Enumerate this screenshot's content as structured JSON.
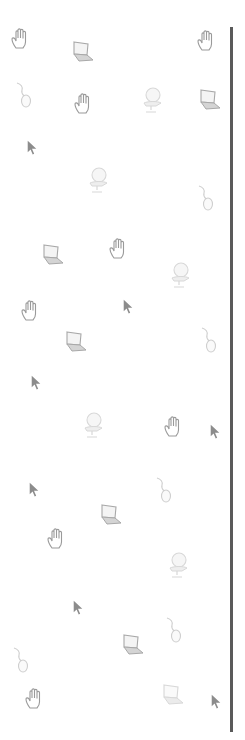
{
  "colors": {
    "background": "#ffffff",
    "rule": "#5a5a5a",
    "hand_stroke": "#9a9a9a",
    "laptop_stroke": "#a8a8a8",
    "laptop_fill": "#d4d4d4",
    "mouse_stroke": "#cfcfcf",
    "chair_stroke": "#d8d8d8",
    "arrow_fill": "#8c8c8c"
  },
  "rule": {
    "x": 230,
    "top": 27,
    "height": 705
  },
  "icons": [
    {
      "type": "hand-icon",
      "x": 22,
      "y": 40
    },
    {
      "type": "hand-icon",
      "x": 208,
      "y": 42
    },
    {
      "type": "hand-icon",
      "x": 85,
      "y": 105
    },
    {
      "type": "hand-icon",
      "x": 120,
      "y": 250
    },
    {
      "type": "hand-icon",
      "x": 32,
      "y": 312
    },
    {
      "type": "hand-icon",
      "x": 175,
      "y": 428
    },
    {
      "type": "hand-icon",
      "x": 58,
      "y": 540
    },
    {
      "type": "hand-icon",
      "x": 36,
      "y": 700
    },
    {
      "type": "laptop-icon",
      "x": 82,
      "y": 52
    },
    {
      "type": "laptop-icon",
      "x": 209,
      "y": 100
    },
    {
      "type": "laptop-icon",
      "x": 52,
      "y": 255
    },
    {
      "type": "laptop-icon",
      "x": 75,
      "y": 342
    },
    {
      "type": "laptop-icon",
      "x": 110,
      "y": 515
    },
    {
      "type": "laptop-icon",
      "x": 132,
      "y": 645
    },
    {
      "type": "laptop-icon",
      "x": 172,
      "y": 695,
      "faint": true
    },
    {
      "type": "mouse-icon",
      "x": 25,
      "y": 95
    },
    {
      "type": "mouse-icon",
      "x": 207,
      "y": 198
    },
    {
      "type": "mouse-icon",
      "x": 210,
      "y": 340
    },
    {
      "type": "mouse-icon",
      "x": 165,
      "y": 490
    },
    {
      "type": "mouse-icon",
      "x": 22,
      "y": 660
    },
    {
      "type": "mouse-icon",
      "x": 175,
      "y": 630
    },
    {
      "type": "chair-icon",
      "x": 152,
      "y": 100
    },
    {
      "type": "chair-icon",
      "x": 98,
      "y": 180
    },
    {
      "type": "chair-icon",
      "x": 180,
      "y": 275
    },
    {
      "type": "chair-icon",
      "x": 93,
      "y": 425
    },
    {
      "type": "chair-icon",
      "x": 178,
      "y": 565
    },
    {
      "type": "arrow-cursor-icon",
      "x": 32,
      "y": 148
    },
    {
      "type": "arrow-cursor-icon",
      "x": 128,
      "y": 307
    },
    {
      "type": "arrow-cursor-icon",
      "x": 36,
      "y": 383
    },
    {
      "type": "arrow-cursor-icon",
      "x": 215,
      "y": 432
    },
    {
      "type": "arrow-cursor-icon",
      "x": 34,
      "y": 490
    },
    {
      "type": "arrow-cursor-icon",
      "x": 78,
      "y": 608
    },
    {
      "type": "arrow-cursor-icon",
      "x": 216,
      "y": 702
    }
  ]
}
